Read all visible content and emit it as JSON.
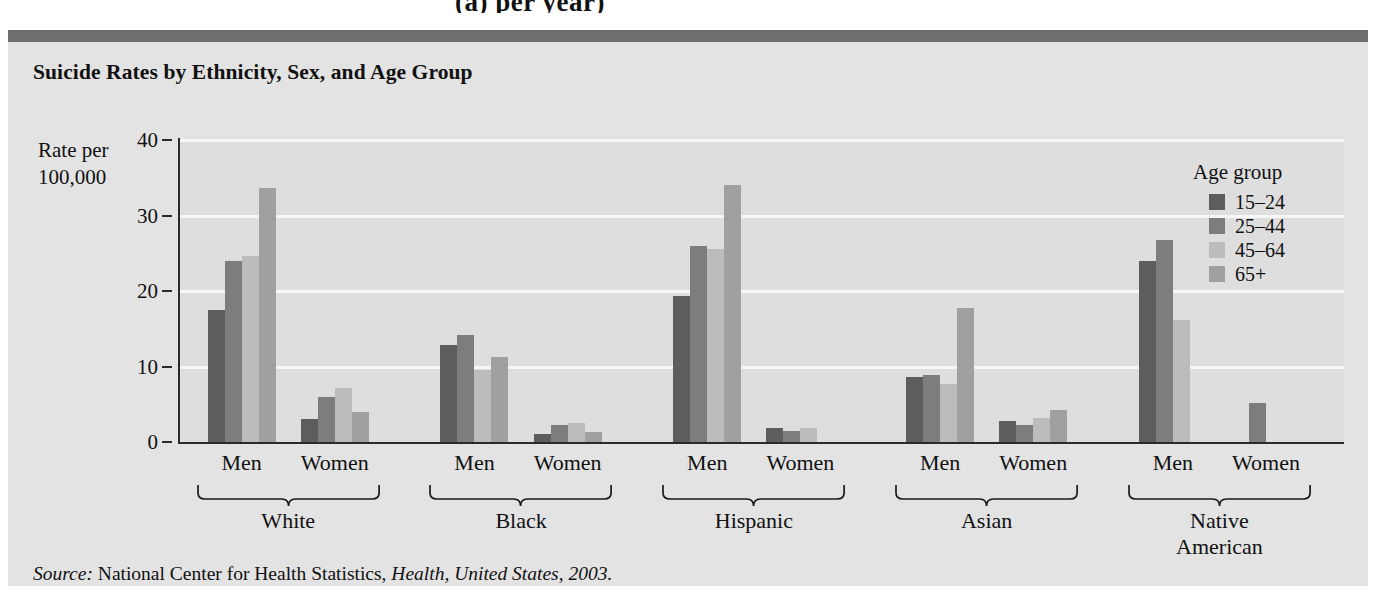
{
  "top_fragment": "(a) per year)",
  "figure": {
    "title": "Suicide Rates by Ethnicity, Sex, and Age Group",
    "y_axis_title_line1": "Rate per",
    "y_axis_title_line2": "100,000",
    "source_prefix": "Source:",
    "source_agency": "National Center for Health Statistics,",
    "source_publication": "Health, United States, 2003."
  },
  "legend": {
    "title": "Age group",
    "entries": [
      {
        "label": "15–24",
        "color": "#5d5d5d"
      },
      {
        "label": "25–44",
        "color": "#7d7d7d"
      },
      {
        "label": "45–64",
        "color": "#bcbcbc"
      },
      {
        "label": "65+",
        "color": "#a0a0a0"
      }
    ]
  },
  "chart_data": {
    "type": "bar",
    "title": "Suicide Rates by Ethnicity, Sex, and Age Group",
    "xlabel": "",
    "ylabel": "Rate per 100,000",
    "ylim": [
      0,
      40
    ],
    "yticks": [
      0,
      10,
      20,
      30,
      40
    ],
    "grid": true,
    "legend_position": "top-right",
    "legend_title": "Age group",
    "series": [
      {
        "name": "15–24",
        "color": "#5d5d5d"
      },
      {
        "name": "25–44",
        "color": "#7d7d7d"
      },
      {
        "name": "45–64",
        "color": "#bcbcbc"
      },
      {
        "name": "65+",
        "color": "#a0a0a0"
      }
    ],
    "categories": [
      "White Men",
      "White Women",
      "Black Men",
      "Black Women",
      "Hispanic Men",
      "Hispanic Women",
      "Asian Men",
      "Asian Women",
      "Native American Men",
      "Native American Women"
    ],
    "groups": [
      {
        "ethnicity": "White",
        "sexes": [
          {
            "sex": "Men",
            "values": [
              17.5,
              24.0,
              24.6,
              33.6
            ]
          },
          {
            "sex": "Women",
            "values": [
              3.1,
              6.0,
              7.1,
              4.0
            ]
          }
        ]
      },
      {
        "ethnicity": "Black",
        "sexes": [
          {
            "sex": "Men",
            "values": [
              12.8,
              14.2,
              9.5,
              11.3
            ]
          },
          {
            "sex": "Women",
            "values": [
              1.0,
              2.3,
              2.5,
              1.3
            ]
          }
        ]
      },
      {
        "ethnicity": "Hispanic",
        "sexes": [
          {
            "sex": "Men",
            "values": [
              19.3,
              26.0,
              25.5,
              34.0
            ]
          },
          {
            "sex": "Women",
            "values": [
              1.8,
              1.5,
              1.8,
              0.0
            ]
          }
        ]
      },
      {
        "ethnicity": "Asian",
        "sexes": [
          {
            "sex": "Men",
            "values": [
              8.6,
              8.9,
              7.7,
              17.8
            ]
          },
          {
            "sex": "Women",
            "values": [
              2.8,
              2.2,
              3.2,
              4.2
            ]
          }
        ]
      },
      {
        "ethnicity": "Native\nAmerican",
        "sexes": [
          {
            "sex": "Men",
            "values": [
              24.0,
              26.8,
              16.2,
              0.0
            ]
          },
          {
            "sex": "Women",
            "values": [
              0.0,
              5.2,
              0.0,
              0.0
            ]
          }
        ]
      }
    ]
  },
  "axis": {
    "sex_labels": [
      "Men",
      "Women"
    ],
    "ethnicity_labels": [
      "White",
      "Black",
      "Hispanic",
      "Asian",
      "Native American"
    ]
  }
}
